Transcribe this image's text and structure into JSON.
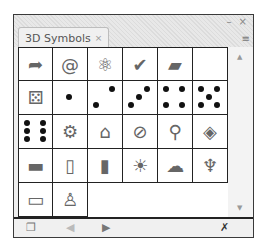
{
  "panel": {
    "tab_label": "3D Symbols",
    "tab_close": "×",
    "minimize": "–",
    "close": "×",
    "menu_icon": "≡"
  },
  "symbols": [
    {
      "name": "arrow",
      "glyph": "➦"
    },
    {
      "name": "at-sign",
      "glyph": "@"
    },
    {
      "name": "atom",
      "glyph": "⚛"
    },
    {
      "name": "checkmark",
      "glyph": "✔"
    },
    {
      "name": "box",
      "glyph": "▰"
    },
    {
      "name": "blank",
      "glyph": ""
    },
    {
      "name": "dice-pair",
      "glyph": "⚄"
    },
    {
      "name": "die-1",
      "dots": [
        4
      ]
    },
    {
      "name": "die-2",
      "dots": [
        2,
        6
      ]
    },
    {
      "name": "die-3",
      "dots": [
        2,
        4,
        6
      ]
    },
    {
      "name": "die-4",
      "dots": [
        0,
        2,
        6,
        8
      ]
    },
    {
      "name": "die-5",
      "dots": [
        0,
        2,
        4,
        6,
        8
      ]
    },
    {
      "name": "die-6",
      "dots": [
        0,
        2,
        3,
        5,
        6,
        8
      ]
    },
    {
      "name": "gear",
      "glyph": "⚙"
    },
    {
      "name": "house",
      "glyph": "⌂"
    },
    {
      "name": "no-sign",
      "glyph": "⊘"
    },
    {
      "name": "magnifier",
      "glyph": "⚲"
    },
    {
      "name": "cube",
      "glyph": "◈"
    },
    {
      "name": "map-texture",
      "glyph": "▬"
    },
    {
      "name": "paper",
      "glyph": "▯"
    },
    {
      "name": "picture",
      "glyph": "▮"
    },
    {
      "name": "sun",
      "glyph": "☀"
    },
    {
      "name": "cloud",
      "glyph": "☁"
    },
    {
      "name": "spinning-top",
      "glyph": "♆"
    },
    {
      "name": "stripe-texture",
      "glyph": "▭"
    },
    {
      "name": "bottle",
      "glyph": "♙"
    }
  ],
  "footer": {
    "library_icon": "❐",
    "prev_icon": "◀",
    "next_icon": "▶",
    "break_link_icon": "✗"
  }
}
